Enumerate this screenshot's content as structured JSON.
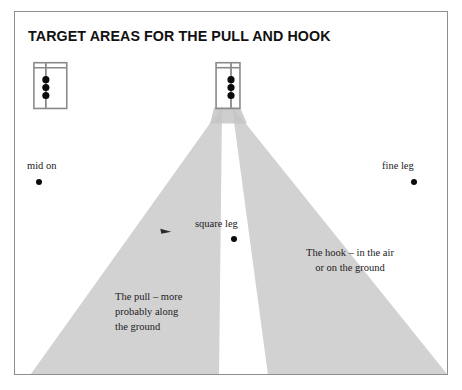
{
  "figure": {
    "title": "TARGET AREAS FOR THE PULL AND HOOK",
    "frame_border_color": "#8e8e8e",
    "background_color": "#ffffff"
  },
  "diagram": {
    "type": "cricket-field-target-area-diagram",
    "shading_color": "#d2d2d2",
    "wicket_line_color": "#7a7a7a",
    "stump_color": "#0b0b0b",
    "wickets": [
      {
        "name": "bowlers-end-wicket",
        "crease_box": {
          "x": 33,
          "y": 62,
          "width": 33,
          "height": 46
        },
        "popping_crease_y": 67,
        "stump_line_x": 45,
        "stumps": 3
      },
      {
        "name": "batsmans-end-wicket",
        "crease_box": {
          "x": 216,
          "y": 62,
          "width": 24,
          "height": 46
        },
        "popping_crease_y": 67,
        "stump_line_x": 231,
        "stumps": 3
      }
    ],
    "shaded_wedges": [
      {
        "name": "pull-target-area",
        "label_ref": "pull",
        "apex": {
          "x": 222,
          "y": 106
        },
        "base_left": {
          "x": 30,
          "y": 364
        },
        "base_right": {
          "x": 219,
          "y": 364
        }
      },
      {
        "name": "hook-target-area",
        "label_ref": "hook",
        "apex": {
          "x": 232,
          "y": 106
        },
        "base_left": {
          "x": 268,
          "y": 364
        },
        "base_right": {
          "x": 462,
          "y": 364
        }
      }
    ],
    "marker": {
      "name": "batsman-shot-marker",
      "x": 162,
      "y": 229
    }
  },
  "labels": {
    "mid_on": "mid on",
    "fine_leg": "fine leg",
    "square_leg": "square leg"
  },
  "annotations": {
    "hook": "The hook – in the air\nor on the ground",
    "pull": "The pull – more\nprobably along\nthe ground"
  }
}
